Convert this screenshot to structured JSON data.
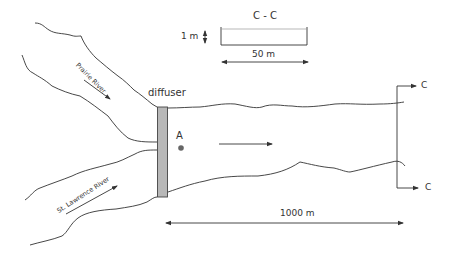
{
  "figure": {
    "type": "schematic"
  },
  "labels": {
    "diffuser": "diffuser",
    "point_a": "A",
    "prairie_river": "Prairie River",
    "st_lawrence_river": "St. Lawrence River",
    "distance": "1000 m",
    "section_top": "C",
    "section_bottom": "C"
  },
  "cross_section": {
    "title": "C - C",
    "depth_label": "1 m",
    "width_label": "50 m"
  },
  "colors": {
    "line": "#333333",
    "diffuser_fill": "#b8b8b8",
    "point_fill": "#666666"
  }
}
